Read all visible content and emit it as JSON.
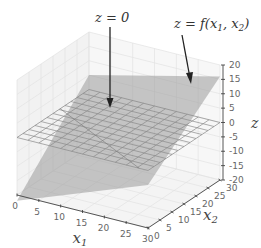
{
  "chart_data": {
    "type": "surface3d",
    "title": "",
    "annotations": [
      {
        "label": "z = 0",
        "text_parts": [
          "z",
          " = 0"
        ],
        "target": "zero-plane"
      },
      {
        "label": "z = f(x1, x2)",
        "text_parts": [
          "z = f(x",
          "1",
          ", x",
          "2",
          ")"
        ],
        "target": "function-plane"
      }
    ],
    "axes": {
      "x1": {
        "label": "x",
        "sub": "1",
        "ticks": [
          0,
          5,
          10,
          15,
          20,
          25,
          30
        ],
        "range": [
          0,
          30
        ]
      },
      "x2": {
        "label": "x",
        "sub": "2",
        "ticks": [
          0,
          5,
          10,
          15,
          20,
          25,
          30
        ],
        "range": [
          0,
          30
        ]
      },
      "z": {
        "label": "z",
        "ticks": [
          20,
          15,
          10,
          5,
          0,
          -5,
          -10,
          -15,
          -20
        ],
        "range": [
          -20,
          20
        ]
      }
    },
    "surfaces": [
      {
        "name": "zero-plane",
        "style": "wireframe",
        "z": 0,
        "grid_step": 2.5,
        "color": "#888888"
      },
      {
        "name": "function-plane",
        "style": "surface",
        "color": "#9a9a9a",
        "alpha": 0.55,
        "corners": [
          {
            "x1": 0,
            "x2": 0,
            "z": -22
          },
          {
            "x1": 30,
            "x2": 0,
            "z": -5
          },
          {
            "x1": 30,
            "x2": 30,
            "z": 16
          },
          {
            "x1": 0,
            "x2": 30,
            "z": 5
          }
        ]
      }
    ],
    "grid": true,
    "pane_color": "#f2f2f2"
  },
  "ticks_z": [
    "20",
    "15",
    "10",
    "5",
    "0",
    "-5",
    "-10",
    "-15",
    "-20"
  ],
  "ticks_x1": [
    "0",
    "5",
    "10",
    "15",
    "20",
    "25",
    "30"
  ],
  "ticks_x2": [
    "0",
    "5",
    "10",
    "15",
    "20",
    "25",
    "30"
  ]
}
